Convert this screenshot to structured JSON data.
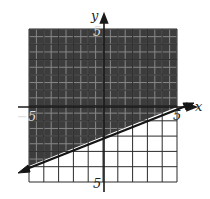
{
  "chart_data": {
    "type": "line",
    "title": "",
    "xlabel": "x",
    "ylabel": "y",
    "xlim": [
      -5,
      5
    ],
    "ylim": [
      -5,
      5
    ],
    "grid": true,
    "tick_labels": {
      "x_neg": "-5",
      "x_pos": "5",
      "y_pos": "5",
      "y_neg": "5"
    },
    "boundary_line": {
      "slope": 0.4,
      "intercept": -2,
      "style": "solid",
      "points": [
        [
          -5,
          -4
        ],
        [
          0,
          -2
        ],
        [
          5,
          0
        ]
      ]
    },
    "inequality": "y >= (2/5)x - 2",
    "shaded_region": "above",
    "colors": {
      "shade": "#3a3a3a",
      "grid": "#333333",
      "line": "#1a1a1a"
    }
  },
  "labels": {
    "x_axis": "x",
    "y_axis": "y",
    "x_neg": "−5",
    "x_pos": "5",
    "y_top": "5",
    "y_bottom": "5"
  }
}
